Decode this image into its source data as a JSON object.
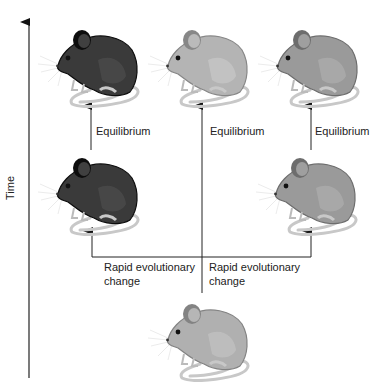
{
  "axis": {
    "label": "Time"
  },
  "labels": {
    "equilibrium_left": "Equilibrium",
    "equilibrium_center": "Equilibrium",
    "equilibrium_right": "Equilibrium",
    "rapid_left_1": "Rapid evolutionary",
    "rapid_left_2": "change",
    "rapid_right_1": "Rapid evolutionary",
    "rapid_right_2": "change"
  },
  "mice": [
    {
      "id": "top-left",
      "shade": "dark",
      "color": "#3a3a3a"
    },
    {
      "id": "top-center",
      "shade": "light",
      "color": "#b4b4b4"
    },
    {
      "id": "top-right",
      "shade": "medium",
      "color": "#9a9a9a"
    },
    {
      "id": "middle-left",
      "shade": "dark",
      "color": "#3a3a3a"
    },
    {
      "id": "middle-right",
      "shade": "medium",
      "color": "#9a9a9a"
    },
    {
      "id": "bottom-ancestor",
      "shade": "light",
      "color": "#b0b0b0"
    }
  ]
}
